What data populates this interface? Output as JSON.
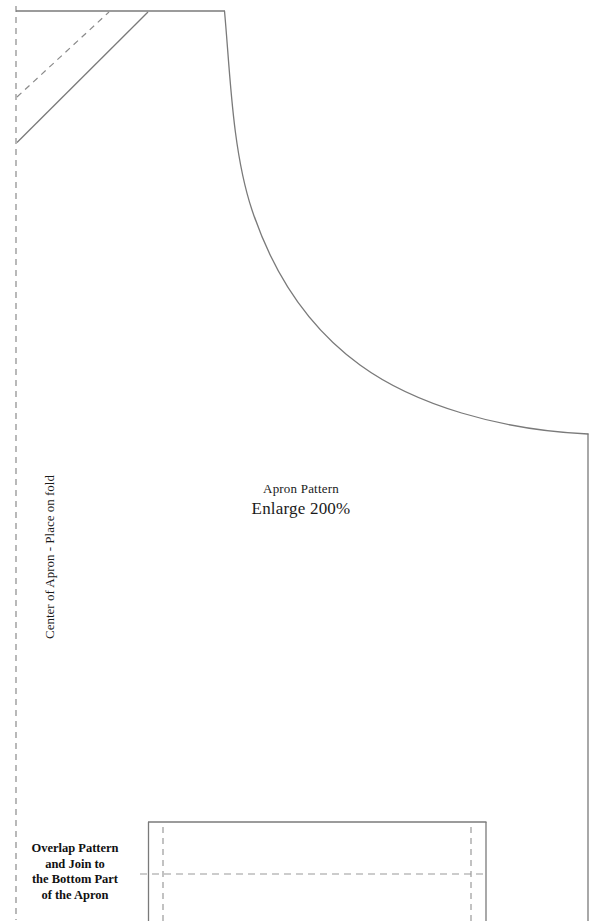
{
  "document": {
    "kind": "sewing-pattern-sheet",
    "width": 602,
    "height": 923,
    "background_color": "#ffffff",
    "line_color": "#7a7a7a",
    "text_color": "#1a1a1a"
  },
  "labels": {
    "title": "Apron Pattern",
    "scale_note": "Enlarge 200%",
    "fold_line": "Center of Apron - Place on fold",
    "overlap_note": "Overlap Pattern\nand Join to\nthe Bottom Part\nof the Apron",
    "overlap_note_lines": [
      "Overlap Pattern",
      "and Join to",
      "the Bottom Part",
      "of the Apron"
    ]
  },
  "geometry": {
    "fold_line": {
      "x": 16,
      "y_top": 6,
      "y_bottom": 920,
      "style": "dashed"
    },
    "top_edge": {
      "x_start": 16,
      "x_end": 224,
      "y": 11,
      "style": "solid"
    },
    "bib_strap_solid": {
      "x1": 17,
      "y1": 142,
      "x2": 148,
      "y2": 12,
      "style": "solid"
    },
    "bib_strap_dashed": {
      "x1": 17,
      "y1": 97,
      "x2": 109,
      "y2": 12,
      "style": "dashed"
    },
    "side_curve": {
      "start": [
        224,
        11
      ],
      "control_points": [
        [
          231,
          120
        ],
        [
          252,
          250
        ],
        [
          330,
          345
        ],
        [
          470,
          412
        ]
      ],
      "end": [
        588,
        434
      ],
      "style": "solid"
    },
    "right_edge": {
      "x": 588,
      "y_top": 434,
      "y_bottom": 920,
      "style": "solid"
    },
    "bottom_panel": {
      "left_edge_x": 148,
      "right_edge_x": 486,
      "top_edge_y": 822,
      "bottom_y": 921,
      "style": "solid"
    },
    "bottom_panel_guides": [
      {
        "name": "left-seam-guide",
        "x": 163,
        "y_top": 826,
        "y_bottom": 921,
        "style": "dashed"
      },
      {
        "name": "right-seam-guide",
        "x": 471,
        "y_top": 826,
        "y_bottom": 921,
        "style": "dashed"
      },
      {
        "name": "overlap-join-guide",
        "y": 874,
        "x_start": 140,
        "x_end": 488,
        "style": "dashed"
      }
    ]
  }
}
